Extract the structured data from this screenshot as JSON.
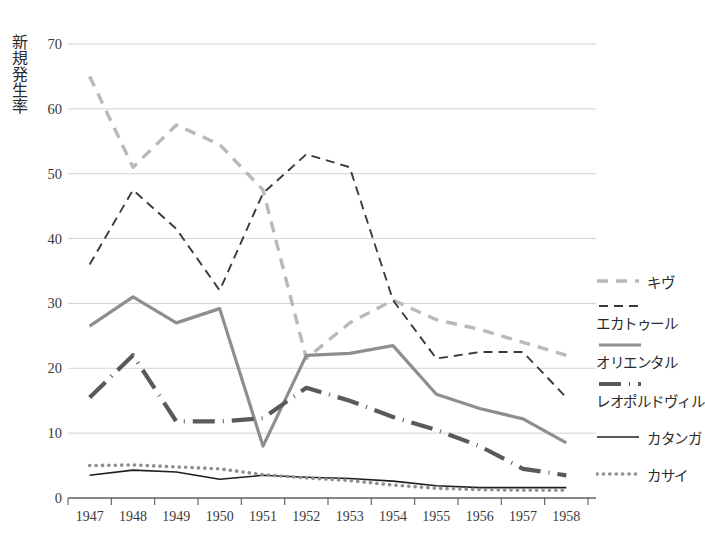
{
  "chart_data": {
    "type": "line",
    "title": "",
    "xlabel": "",
    "ylabel": "新規発生率",
    "categories": [
      "1947",
      "1948",
      "1949",
      "1950",
      "1951",
      "1952",
      "1953",
      "1954",
      "1955",
      "1956",
      "1957",
      "1958"
    ],
    "ylim": [
      0,
      70
    ],
    "yticks": [
      0,
      10,
      20,
      30,
      40,
      50,
      60,
      70
    ],
    "ytick_labels": [
      "0",
      "10",
      "20",
      "30",
      "40",
      "50",
      "60",
      "70"
    ],
    "grid": true,
    "legend_position": "right",
    "series": [
      {
        "name": "キヴ",
        "style": "dashed",
        "color": "#b9b9b9",
        "width": 3.4,
        "values": [
          65.0,
          51.0,
          57.5,
          54.5,
          47.5,
          21.5,
          27.0,
          30.5,
          27.5,
          26.0,
          24.0,
          22.0
        ]
      },
      {
        "name": "エカトゥール",
        "style": "dashed",
        "color": "#3a3a3a",
        "width": 1.9,
        "values": [
          36.0,
          47.5,
          41.5,
          32.0,
          47.0,
          53.0,
          51.0,
          30.5,
          21.5,
          22.5,
          22.5,
          15.5
        ]
      },
      {
        "name": "オリエンタル",
        "style": "solid",
        "color": "#8e8e8e",
        "width": 3.2,
        "values": [
          26.5,
          31.0,
          27.0,
          29.2,
          8.0,
          22.0,
          22.3,
          23.5,
          16.0,
          13.8,
          12.2,
          8.5
        ]
      },
      {
        "name": "レオポルドヴィル",
        "style": "dashdot",
        "color": "#5a5a5a",
        "width": 4.2,
        "values": [
          15.5,
          22.0,
          11.8,
          11.8,
          12.3,
          17.0,
          15.0,
          12.5,
          10.5,
          8.0,
          4.5,
          3.5
        ]
      },
      {
        "name": "カタンガ",
        "style": "solid",
        "color": "#1f1f1f",
        "width": 1.6,
        "values": [
          3.5,
          4.3,
          4.0,
          2.9,
          3.5,
          3.2,
          3.0,
          2.6,
          1.9,
          1.6,
          1.6,
          1.6
        ]
      },
      {
        "name": "カサイ",
        "style": "dotted",
        "color": "#8e8e8e",
        "width": 3.6,
        "values": [
          5.0,
          5.1,
          4.8,
          4.5,
          3.6,
          3.1,
          2.7,
          2.0,
          1.5,
          1.3,
          1.2,
          1.2
        ]
      }
    ]
  },
  "axis": {
    "ylabel": "新規発生率",
    "ytick_labels": [
      "70",
      "60",
      "50",
      "40",
      "30",
      "20",
      "10",
      "0"
    ],
    "xtick_labels": [
      "1947",
      "1948",
      "1949",
      "1950",
      "1951",
      "1952",
      "1953",
      "1954",
      "1955",
      "1956",
      "1957",
      "1958"
    ]
  },
  "legend": {
    "items": [
      {
        "label": "キヴ",
        "swatch": "dashed-light-swatch"
      },
      {
        "label": "エカトゥール",
        "swatch": "dashed-dark-swatch"
      },
      {
        "label": "オリエンタル",
        "swatch": "solid-gray-swatch"
      },
      {
        "label": "レオポルドヴィル",
        "swatch": "dashdot-swatch"
      },
      {
        "label": "カタンガ",
        "swatch": "solid-black-swatch"
      },
      {
        "label": "カサイ",
        "swatch": "dotted-gray-swatch"
      }
    ]
  }
}
